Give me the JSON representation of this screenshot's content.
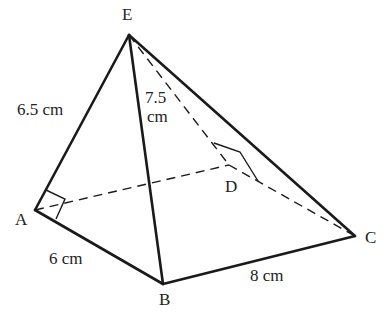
{
  "diagram": {
    "type": "square-based pyramid",
    "vertices": {
      "A": {
        "label": "A",
        "x": 35,
        "y": 210
      },
      "B": {
        "label": "B",
        "x": 163,
        "y": 284
      },
      "C": {
        "label": "C",
        "x": 355,
        "y": 236
      },
      "D": {
        "label": "D",
        "x": 229,
        "y": 165
      },
      "E": {
        "label": "E",
        "x": 129,
        "y": 35
      }
    },
    "edges": {
      "EA": {
        "label": "6.5 cm",
        "style": "solid"
      },
      "EB": {
        "label_line1": "7.5",
        "label_line2": "cm",
        "style": "solid"
      },
      "EC": {
        "style": "solid"
      },
      "AB": {
        "label": "6 cm",
        "style": "solid"
      },
      "BC": {
        "label": "8 cm",
        "style": "solid"
      },
      "AD": {
        "style": "dashed"
      },
      "DC": {
        "style": "dashed"
      },
      "ED": {
        "style": "dashed"
      }
    },
    "right_angles": [
      "A",
      "D"
    ],
    "line_color": "#1a1a1a"
  }
}
